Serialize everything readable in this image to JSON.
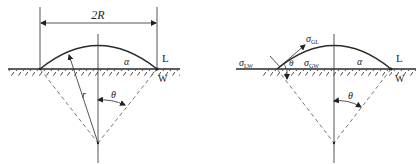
{
  "figure": {
    "left_panel": {
      "dimension_label": "2R",
      "radius_label": "r",
      "contact_angle_label": "θ",
      "drop_label": "α",
      "liquid_label": "L",
      "solid_label": "W"
    },
    "right_panel": {
      "liquid_wall_tension": "σ",
      "liquid_wall_sub": "LW",
      "gas_liquid_tension": "σ",
      "gas_liquid_sub": "GL",
      "gas_wall_tension": "σ",
      "gas_wall_sub": "GW",
      "contact_angle_label": "θ",
      "center_angle_label": "θ",
      "drop_label": "α",
      "liquid_label": "L",
      "solid_label": "W"
    }
  },
  "colors": {
    "line": "#2a2a2a",
    "dash": "#555555",
    "background": "#ffffff"
  }
}
